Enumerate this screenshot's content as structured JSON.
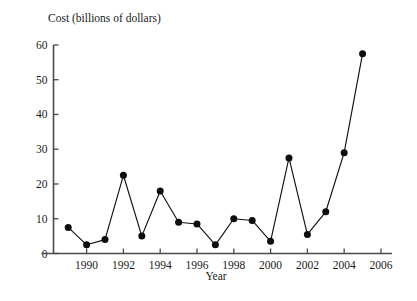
{
  "chart_data": {
    "type": "line",
    "title": "",
    "xlabel": "Year",
    "ylabel": "Cost (billions of dollars)",
    "x": [
      1989,
      1990,
      1991,
      1992,
      1993,
      1994,
      1995,
      1996,
      1997,
      1998,
      1999,
      2000,
      2001,
      2002,
      2003,
      2004,
      2005
    ],
    "values": [
      7.5,
      2.5,
      4.0,
      22.5,
      5.0,
      18.0,
      9.0,
      8.5,
      2.5,
      10.0,
      9.5,
      3.5,
      27.5,
      5.5,
      12.0,
      29.0,
      57.5
    ],
    "series": [
      {
        "name": "Cost",
        "values": [
          7.5,
          2.5,
          4.0,
          22.5,
          5.0,
          18.0,
          9.0,
          8.5,
          2.5,
          10.0,
          9.5,
          3.5,
          27.5,
          5.5,
          12.0,
          29.0,
          57.5
        ]
      }
    ],
    "xlim": [
      1988.2,
      2006.6
    ],
    "ylim": [
      0,
      62
    ],
    "xticks": [
      1990,
      1992,
      1994,
      1996,
      1998,
      2000,
      2002,
      2004,
      2006
    ],
    "xtick_labels": [
      "1990",
      "1992",
      "1994",
      "1996",
      "1998",
      "2000",
      "2002",
      "2004",
      "2006"
    ],
    "yticks": [
      0,
      10,
      20,
      30,
      40,
      50,
      60
    ],
    "ytick_labels": [
      "0",
      "10",
      "20",
      "30",
      "40",
      "50",
      "60"
    ],
    "grid": false,
    "legend": false,
    "legend_position": "none",
    "marker": "filled-circle",
    "line_color": "#111111",
    "marker_color": "#0d0d0d",
    "axis_color": "#4a4a4a",
    "background_color": "#ffffff"
  }
}
